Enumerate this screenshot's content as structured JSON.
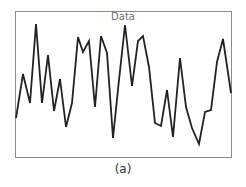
{
  "chart_data": {
    "type": "line",
    "title": "Data",
    "caption": "(a)",
    "xlabel": "",
    "ylabel": "",
    "grid": false,
    "legend": null,
    "axes_ticks": "none",
    "series": [
      {
        "name": "Data",
        "color": "#222222",
        "points_px": [
          [
            16,
            118
          ],
          [
            23,
            74
          ],
          [
            30,
            103
          ],
          [
            36,
            24
          ],
          [
            42,
            103
          ],
          [
            48,
            55
          ],
          [
            54,
            111
          ],
          [
            60,
            79
          ],
          [
            66,
            127
          ],
          [
            72,
            103
          ],
          [
            78,
            37
          ],
          [
            83,
            52
          ],
          [
            89,
            41
          ],
          [
            95,
            107
          ],
          [
            101,
            36
          ],
          [
            107,
            53
          ],
          [
            113,
            138
          ],
          [
            119,
            80
          ],
          [
            125,
            25
          ],
          [
            132,
            86
          ],
          [
            138,
            41
          ],
          [
            143,
            36
          ],
          [
            149,
            67
          ],
          [
            155,
            123
          ],
          [
            161,
            126
          ],
          [
            167,
            90
          ],
          [
            173,
            137
          ],
          [
            180,
            58
          ],
          [
            186,
            107
          ],
          [
            192,
            128
          ],
          [
            199,
            144
          ],
          [
            205,
            112
          ],
          [
            211,
            110
          ],
          [
            217,
            62
          ],
          [
            223,
            39
          ],
          [
            231,
            93
          ]
        ],
        "values_normalized": [
          0.3,
          0.61,
          0.41,
          0.94,
          0.41,
          0.74,
          0.35,
          0.57,
          0.24,
          0.41,
          0.86,
          0.76,
          0.83,
          0.38,
          0.86,
          0.75,
          0.15,
          0.56,
          0.93,
          0.51,
          0.83,
          0.86,
          0.65,
          0.27,
          0.25,
          0.49,
          0.16,
          0.69,
          0.38,
          0.23,
          0.12,
          0.34,
          0.35,
          0.68,
          0.84,
          0.47
        ]
      }
    ]
  },
  "labels": {
    "title": "Data",
    "caption": "(a)"
  }
}
